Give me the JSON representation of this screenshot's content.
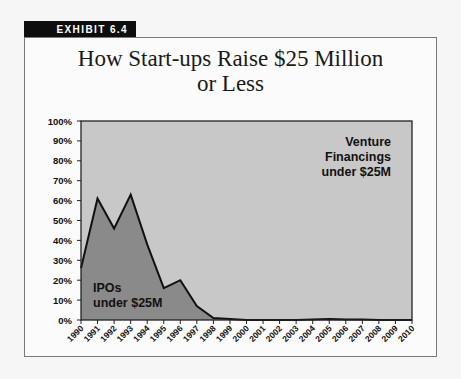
{
  "exhibit_label": "EXHIBIT 6.4",
  "title_line1": "How Start-ups Raise $25 Million",
  "title_line2": "or Less",
  "colors": {
    "venture_fill": "#c8c8c8",
    "ipo_fill": "#8a8a8a",
    "line": "#111111",
    "tag_bg": "#0d0d0d"
  },
  "chart_data": {
    "type": "area",
    "title": "How Start-ups Raise $25 Million or Less",
    "xlabel": "",
    "ylabel": "",
    "ylim": [
      0,
      100
    ],
    "y_tick_labels": [
      "0%",
      "10%",
      "20%",
      "30%",
      "40%",
      "50%",
      "60%",
      "70%",
      "80%",
      "90%",
      "100%"
    ],
    "categories": [
      "1990",
      "1991",
      "1992",
      "1993",
      "1994",
      "1995",
      "1996",
      "1997",
      "1998",
      "1999",
      "2000",
      "2001",
      "2002",
      "2003",
      "2004",
      "2005",
      "2006",
      "2007",
      "2008",
      "2009",
      "2010"
    ],
    "series": [
      {
        "name": "IPOs under $25M",
        "values": [
          26,
          61,
          46,
          63,
          38,
          16,
          20,
          7,
          1,
          0.5,
          0,
          0,
          0,
          0,
          0.3,
          0.5,
          0.2,
          0.2,
          0,
          0,
          0
        ]
      },
      {
        "name": "Venture Financings under $25M",
        "values": [
          74,
          39,
          54,
          37,
          62,
          84,
          80,
          93,
          99,
          99.5,
          100,
          100,
          100,
          100,
          99.7,
          99.5,
          99.8,
          99.8,
          100,
          100,
          100
        ]
      }
    ],
    "stacked": true,
    "percent_stacked": true,
    "annotations": [
      {
        "text": [
          "IPOs",
          "under $25M"
        ],
        "position": "lower-left"
      },
      {
        "text": [
          "Venture",
          "Financings",
          "under $25M"
        ],
        "position": "upper-right"
      }
    ],
    "grid": false,
    "legend": "none (inline annotations)"
  }
}
